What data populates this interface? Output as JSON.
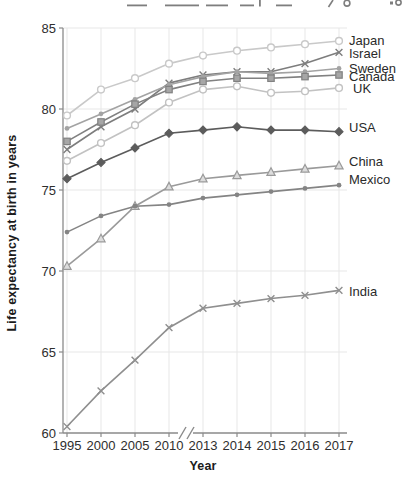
{
  "figure": {
    "y_axis_title": "Life expectancy at birth in years",
    "x_axis_title": "Year",
    "top_edge_note": "cropped descenders of a text line from the page above"
  },
  "style_colors": {
    "background": "#ffffff",
    "spine": "#8a8a8a",
    "gridline": "#e7e7e7",
    "tick_text": "#2e2e2e",
    "legend_text": "#2a2a2a",
    "title_text": "#1b1b1b"
  },
  "chart_data": {
    "type": "line",
    "title": "",
    "xlabel": "Year",
    "ylabel": "Life expectancy at birth in years",
    "categories": [
      "1995",
      "2000",
      "2005",
      "2010",
      "2013",
      "2014",
      "2015",
      "2016",
      "2017"
    ],
    "y_ticks": [
      60,
      65,
      70,
      75,
      80,
      85
    ],
    "ylim": [
      60,
      85
    ],
    "grid": true,
    "x_axis_break_between": [
      "2010",
      "2013"
    ],
    "legend_position": "right-of-line-ends",
    "series": [
      {
        "name": "Japan",
        "marker": "circle-open",
        "color": "#c9c9c9",
        "marker_fill": "#ffffff",
        "label_dx": 0,
        "label_dy": 0,
        "values": [
          79.6,
          81.2,
          81.9,
          82.8,
          83.3,
          83.6,
          83.8,
          84.0,
          84.2
        ]
      },
      {
        "name": "Israel",
        "marker": "x",
        "color": "#7d7d7d",
        "marker_fill": "none",
        "label_dx": 0,
        "label_dy": 1,
        "values": [
          77.5,
          78.9,
          80.0,
          81.6,
          82.1,
          82.3,
          82.3,
          82.8,
          83.5
        ]
      },
      {
        "name": "Sweden",
        "marker": "dot",
        "color": "#a3a3a3",
        "marker_fill": "#a3a3a3",
        "label_dx": 0,
        "label_dy": 0,
        "values": [
          78.8,
          79.7,
          80.6,
          81.5,
          82.0,
          82.3,
          82.2,
          82.3,
          82.5
        ]
      },
      {
        "name": "Canada",
        "marker": "square",
        "color": "#818181",
        "marker_fill": "#a6a6a6",
        "label_dx": 0,
        "label_dy": 2,
        "values": [
          78.0,
          79.2,
          80.3,
          81.2,
          81.7,
          81.9,
          81.9,
          82.0,
          82.1
        ]
      },
      {
        "name": "UK",
        "marker": "circle-open",
        "color": "#c2c2c2",
        "marker_fill": "#ffffff",
        "label_dx": 4,
        "label_dy": 1,
        "values": [
          76.8,
          77.9,
          79.0,
          80.4,
          81.2,
          81.4,
          81.0,
          81.1,
          81.3
        ]
      },
      {
        "name": "USA",
        "marker": "diamond",
        "color": "#5c5c5c",
        "marker_fill": "#5c5c5c",
        "label_dx": 0,
        "label_dy": -4,
        "values": [
          75.7,
          76.7,
          77.6,
          78.5,
          78.7,
          78.9,
          78.7,
          78.7,
          78.6
        ]
      },
      {
        "name": "China",
        "marker": "triangle-open",
        "color": "#9a9a9a",
        "marker_fill": "#dcdcdc",
        "label_dx": 0,
        "label_dy": -4,
        "values": [
          70.3,
          72.0,
          74.0,
          75.2,
          75.7,
          75.9,
          76.1,
          76.3,
          76.5
        ]
      },
      {
        "name": "Mexico",
        "marker": "dot",
        "color": "#848484",
        "marker_fill": "#848484",
        "label_dx": 0,
        "label_dy": -6,
        "values": [
          72.4,
          73.4,
          74.0,
          74.1,
          74.5,
          74.7,
          74.9,
          75.1,
          75.3
        ]
      },
      {
        "name": "India",
        "marker": "x",
        "color": "#8f8f8f",
        "marker_fill": "none",
        "label_dx": 0,
        "label_dy": 1,
        "values": [
          60.4,
          62.6,
          64.5,
          66.5,
          67.7,
          68.0,
          68.3,
          68.5,
          68.8
        ]
      }
    ]
  }
}
